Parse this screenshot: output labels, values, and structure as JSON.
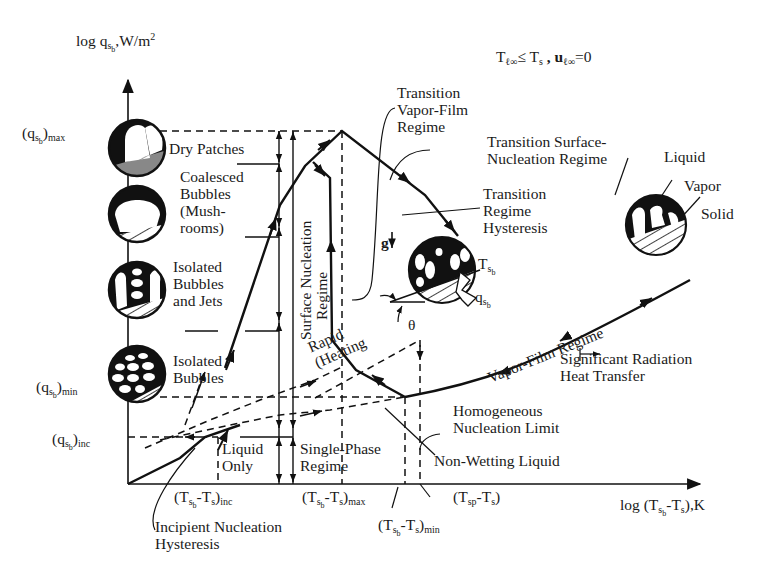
{
  "figure": {
    "condition": "T_l∞ ≤ T_s , u_l∞ = 0",
    "y_axis": {
      "label": "log q_sb, W/m²",
      "ticks": [
        "(q_sb)max",
        "(q_sb)min",
        "(q_sb)inc"
      ]
    },
    "x_axis": {
      "label": "log (T_sb - T_s), K",
      "ticks": [
        "(T_sb-T_s)inc",
        "(T_sb-T_s)max",
        "(T_sp-T_s)",
        "(T_sb-T_s)min"
      ]
    }
  },
  "labels": {
    "y_axis_log": "log q",
    "y_axis_unit": ",W/m",
    "y_axis_sq": "2",
    "cond_T": "T",
    "cond_le": "≤ T",
    "cond_s": "s",
    "cond_u": " , u",
    "cond_eq": "=0",
    "q_max": "max",
    "q_min": "min",
    "q_inc": "inc",
    "dry_patches": "Dry Patches",
    "coalesced": "Coalesced\nBubbles\n(Mush-\nrooms)",
    "isolated_jets": "Isolated\nBubbles\nand Jets",
    "isolated": "Isolated\nBubbles",
    "surface_nucleation": "Surface Nucleation",
    "regime": "Regime",
    "rapid_heating": "Rapid\n(Heating",
    "liquid_only": "Liquid\nOnly",
    "single_phase": "Single-Phase\nRegime",
    "transition_vapor_film": "Transition\nVapor-Film\nRegime",
    "transition_surface": "Transition Surface-\nNucleation Regime",
    "transition_hysteresis": "Transition\nRegime\nHysteresis",
    "liquid": "Liquid",
    "vapor": "Vapor",
    "solid": "Solid",
    "gravity": "g",
    "theta": "θ",
    "ts_b": "T",
    "qs_b": "q",
    "vapor_film": "Vapor-Film Regime",
    "radiation": "Significant Radiation\nHeat Transfer",
    "homogeneous": "Homogeneous\nNucleation Limit",
    "non_wetting": "Non-Wetting Liquid",
    "incipient": "Incipient Nucleation\nHysteresis",
    "x_axis_log": "log (T",
    "x_axis_unit": "),K",
    "inc": "inc",
    "max": "max",
    "min": "min",
    "sp": "sp"
  }
}
